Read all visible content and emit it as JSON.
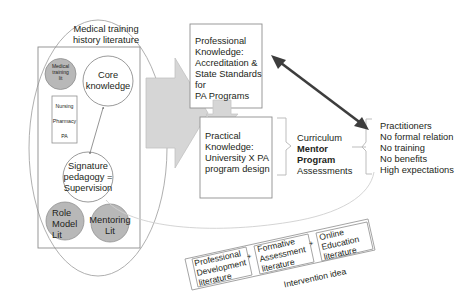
{
  "diagram": {
    "colors": {
      "fill_gray_circle": "#b3b3b3",
      "fill_arrow": "#d4d4d4",
      "stroke_gray": "#9a9a9a",
      "stroke_dark": "#404040",
      "text": "#231f20",
      "background": "#ffffff"
    },
    "ellipse_label": {
      "line1": "Medical training",
      "line2": "history literature"
    },
    "left_cluster": {
      "medical_training_lit": {
        "line1": "Medical",
        "line2": "training",
        "line3": "lit"
      },
      "core_knowledge": {
        "line1": "Core",
        "line2": "knowledge"
      },
      "professions_box": {
        "items": [
          "Nursing",
          "Pharmacy",
          "PA"
        ]
      },
      "signature_pedagogy": {
        "line1": "Signature",
        "line2": "pedagogy =",
        "line3": "Supervision"
      },
      "role_model_lit": {
        "line1": "Role",
        "line2": "Model",
        "line3": "Lit"
      },
      "mentoring_lit": {
        "line1": "Mentoring",
        "line2": "Lit"
      }
    },
    "professional_knowledge_box": {
      "lines": [
        "Professional",
        "Knowledge:",
        "Accreditation &",
        "State Standards for",
        "PA Programs"
      ]
    },
    "practical_knowledge_box": {
      "lines": [
        "Practical",
        "Knowledge:",
        "University X PA",
        "program design"
      ]
    },
    "curriculum_group": {
      "line1": "Curriculum",
      "line2": "Mentor Program",
      "line3": "Assessments"
    },
    "practitioners_list": {
      "items": [
        "Practitioners",
        "No formal relation",
        "No training",
        "No benefits",
        "High expectations"
      ]
    },
    "intervention": {
      "caption": "Intervention idea",
      "operator": "+",
      "boxes": [
        {
          "lines": [
            "Professional",
            "Development",
            "literature"
          ]
        },
        {
          "lines": [
            "Formative",
            "Assessment",
            "literature"
          ]
        },
        {
          "lines": [
            "Online",
            "Education",
            "literature"
          ]
        }
      ]
    }
  }
}
